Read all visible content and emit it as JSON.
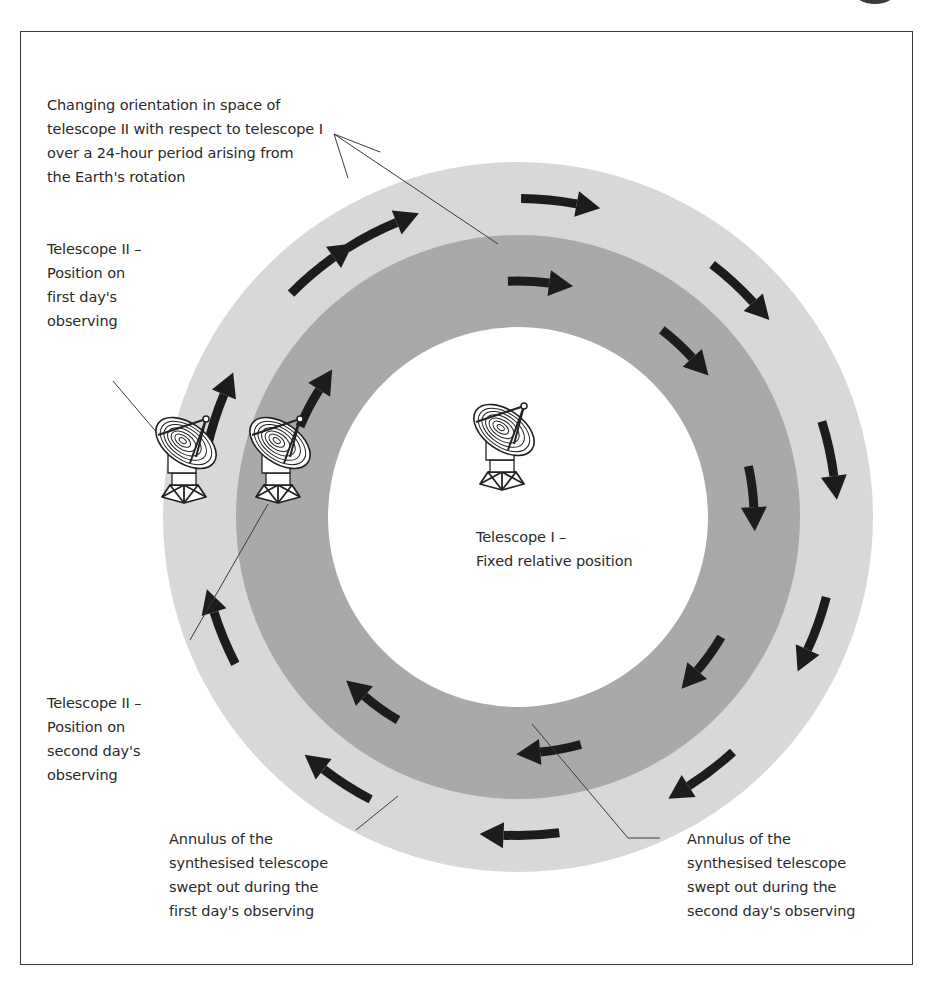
{
  "figure": {
    "colors": {
      "outer_annulus": "#d8d8d8",
      "inner_annulus": "#a9a9a9",
      "center_disc": "#ffffff",
      "arrow": "#1c1c1c",
      "frame": "#3b3b3b",
      "leader_line": "#3a3a3a"
    },
    "labels": {
      "rotation_note": "Changing orientation in space of\ntelescope II with respect to telescope I\nover a 24-hour period arising from\nthe Earth's rotation",
      "telescope2_day1": "Telescope II –\nPosition on\nfirst day's\nobserving",
      "telescope1": "Telescope I –\nFixed relative position",
      "telescope2_day2": "Telescope II –\nPosition on\nsecond day's\nobserving",
      "annulus_day1": "Annulus of the\nsynthesised telescope\nswept out during the\nfirst day's observing",
      "annulus_day2": "Annulus of the\nsynthesised telescope\nswept out during the\nsecond day's observing"
    },
    "icons": {
      "telescope": "radio-telescope-dish-icon",
      "arrow": "clockwise-arrow-icon"
    },
    "rings": {
      "center": [
        518,
        517
      ],
      "outer_radius": 355,
      "middle_radius": 282,
      "inner_radius": 190
    },
    "outer_arrow_angles_deg": [
      -115,
      -82,
      -45,
      -10,
      22,
      55,
      90,
      125,
      160,
      200,
      232
    ],
    "inner_arrow_angles_deg": [
      -85,
      -45,
      -5,
      38,
      82,
      128,
      210
    ]
  }
}
